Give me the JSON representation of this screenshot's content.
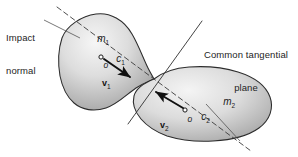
{
  "figure": {
    "background_color": "#ffffff",
    "width": 298,
    "height": 157
  },
  "annotations": {
    "impact_normal": {
      "line1": "Impact",
      "line2": "normal"
    },
    "tangent_plane": {
      "line1": "Common tangential",
      "line2": "plane"
    }
  },
  "bodies": [
    {
      "id": "body-1",
      "mass_label": "m",
      "mass_sub": "1",
      "centroid_label": "c",
      "centroid_sub": "1",
      "contact_point_label": "o",
      "velocity_label": "v",
      "velocity_sub": "1",
      "fill_light": "#efefef",
      "fill_dark": "#8e8e8e",
      "stroke": "#2b2b2b"
    },
    {
      "id": "body-2",
      "mass_label": "m",
      "mass_sub": "2",
      "centroid_label": "c",
      "centroid_sub": "2",
      "contact_point_label": "o",
      "velocity_label": "v",
      "velocity_sub": "2",
      "fill_light": "#efefef",
      "fill_dark": "#8e8e8e",
      "stroke": "#2b2b2b"
    }
  ],
  "lines": {
    "impact_normal_style": "dashed",
    "tangent_plane_style": "solid",
    "leader_style": "solid",
    "line_color": "#3a3a3a",
    "arrow_color": "#101010"
  }
}
